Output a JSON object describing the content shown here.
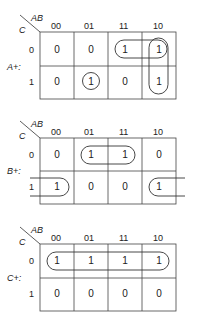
{
  "column_header": "AB",
  "row_header": "C",
  "column_labels": [
    "00",
    "01",
    "11",
    "10"
  ],
  "row_labels": [
    "0",
    "1"
  ],
  "maps": [
    {
      "name": "A+:",
      "values": [
        [
          "0",
          "0",
          "1",
          "1"
        ],
        [
          "0",
          "1",
          "0",
          "1"
        ]
      ],
      "groups": [
        {
          "type": "horizontal",
          "row": 0,
          "cols": [
            2,
            3
          ]
        },
        {
          "type": "vertical",
          "col": 3,
          "rows": [
            0,
            1
          ]
        },
        {
          "type": "single",
          "row": 1,
          "col": 1
        }
      ]
    },
    {
      "name": "B+:",
      "values": [
        [
          "0",
          "1",
          "1",
          "0"
        ],
        [
          "1",
          "0",
          "0",
          "1"
        ]
      ],
      "groups": [
        {
          "type": "horizontal",
          "row": 0,
          "cols": [
            1,
            2
          ]
        },
        {
          "type": "wrap-around",
          "row": 1,
          "cols": [
            0,
            3
          ]
        }
      ]
    },
    {
      "name": "C+:",
      "values": [
        [
          "1",
          "1",
          "1",
          "1"
        ],
        [
          "0",
          "0",
          "0",
          "0"
        ]
      ],
      "groups": [
        {
          "type": "horizontal",
          "row": 0,
          "cols": [
            0,
            1,
            2,
            3
          ]
        }
      ]
    }
  ],
  "colors": {
    "line": "#333333",
    "text": "#222222"
  }
}
